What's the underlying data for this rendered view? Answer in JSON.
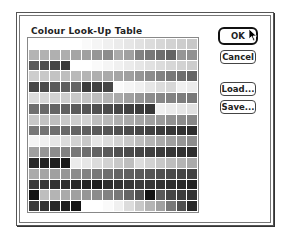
{
  "dialog": {
    "title": "Colour Look-Up Table"
  },
  "buttons": {
    "ok": "OK",
    "cancel": "Cancel",
    "load": "Load...",
    "save": "Save..."
  },
  "grid": {
    "rows": 16,
    "cols": 16,
    "cells": [
      [
        255,
        255,
        255,
        255,
        255,
        250,
        245,
        240,
        235,
        230,
        225,
        220,
        215,
        210,
        205,
        200
      ],
      [
        180,
        178,
        176,
        174,
        165,
        160,
        150,
        140,
        170,
        160,
        130,
        120,
        110,
        100,
        150,
        145
      ],
      [
        90,
        80,
        70,
        60,
        255,
        255,
        250,
        245,
        240,
        235,
        230,
        225,
        220,
        215,
        210,
        205
      ],
      [
        205,
        200,
        195,
        190,
        185,
        180,
        175,
        170,
        165,
        160,
        150,
        140,
        130,
        120,
        110,
        100
      ],
      [
        70,
        75,
        90,
        95,
        100,
        60,
        65,
        70,
        250,
        245,
        240,
        230,
        220,
        215,
        240,
        235
      ],
      [
        220,
        215,
        210,
        205,
        200,
        195,
        190,
        180,
        170,
        160,
        150,
        140,
        135,
        130,
        125,
        120
      ],
      [
        110,
        105,
        100,
        95,
        90,
        85,
        80,
        75,
        70,
        65,
        60,
        55,
        240,
        235,
        230,
        225
      ],
      [
        200,
        195,
        190,
        200,
        205,
        210,
        190,
        185,
        175,
        170,
        165,
        160,
        155,
        145,
        140,
        135
      ],
      [
        120,
        115,
        110,
        105,
        100,
        95,
        90,
        85,
        80,
        75,
        70,
        65,
        60,
        55,
        50,
        45
      ],
      [
        245,
        240,
        230,
        220,
        210,
        200,
        230,
        220,
        210,
        200,
        190,
        180,
        170,
        160,
        150,
        140
      ],
      [
        160,
        150,
        140,
        130,
        120,
        110,
        100,
        90,
        80,
        75,
        70,
        65,
        60,
        55,
        50,
        45
      ],
      [
        40,
        35,
        30,
        25,
        235,
        230,
        220,
        210,
        200,
        190,
        220,
        210,
        200,
        190,
        180,
        170
      ],
      [
        170,
        165,
        160,
        150,
        140,
        130,
        120,
        110,
        100,
        95,
        90,
        85,
        80,
        75,
        70,
        65
      ],
      [
        60,
        55,
        50,
        45,
        40,
        35,
        30,
        45,
        50,
        55,
        60,
        55,
        50,
        45,
        40,
        35
      ],
      [
        20,
        190,
        180,
        170,
        160,
        150,
        140,
        130,
        120,
        100,
        80,
        20,
        90,
        70,
        60,
        50
      ],
      [
        60,
        50,
        40,
        30,
        20,
        255,
        255,
        250,
        240,
        220,
        200,
        180,
        160,
        120,
        80,
        40
      ]
    ]
  }
}
